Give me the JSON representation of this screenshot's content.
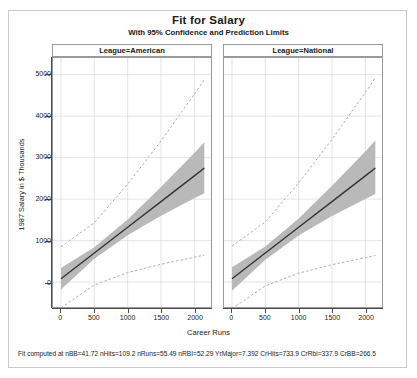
{
  "title": "Fit for Salary",
  "subtitle": "With 95% Confidence and Prediction Limits",
  "axes": {
    "ylabel": "1987 Salary in $ Thousands",
    "xlabel": "Career Runs",
    "yticks": [
      "0",
      "1000",
      "2000",
      "3000",
      "4000",
      "5000"
    ],
    "xticks": [
      "0",
      "500",
      "1000",
      "1500",
      "2000"
    ]
  },
  "panels": [
    {
      "header": "League=American"
    },
    {
      "header": "League=National"
    }
  ],
  "footnote": "Fit computed at nBB=41.72 nHits=109.2 nRuns=55.49 nRBI=52.29 YrMajor=7.392 CrHits=733.9 CrRbi=337.9 CrBB=266.5",
  "colors": {
    "fit_line": "#333333",
    "confidence_band": "#b9b9b9",
    "prediction_line": "#b0a8b8",
    "axis": "#4a4a4a",
    "grid": "#d8d8d8",
    "frame": "#9a9a9a"
  },
  "chart_data": {
    "type": "line",
    "title": "Fit for Salary",
    "subtitle": "With 95% Confidence and Prediction Limits",
    "xlabel": "Career Runs",
    "ylabel": "1987 Salary in $ Thousands",
    "xlim": [
      -120,
      2250
    ],
    "ylim": [
      -600,
      5400
    ],
    "grid": true,
    "legend": "none",
    "panel_variable": "League",
    "panels": [
      {
        "name": "League=American",
        "series": [
          {
            "name": "Fit",
            "style": "solid",
            "x": [
              0,
              500,
              1000,
              1500,
              2000,
              2150
            ],
            "values": [
              80,
              700,
              1320,
              1940,
              2560,
              2750
            ]
          },
          {
            "name": "95% Confidence Lower",
            "style": "band-lower",
            "x": [
              0,
              500,
              1000,
              1500,
              2000,
              2150
            ],
            "values": [
              -180,
              560,
              1130,
              1600,
              2020,
              2140
            ]
          },
          {
            "name": "95% Confidence Upper",
            "style": "band-upper",
            "x": [
              0,
              500,
              1000,
              1500,
              2000,
              2150
            ],
            "values": [
              340,
              840,
              1510,
              2290,
              3110,
              3370
            ]
          },
          {
            "name": "95% Prediction Lower",
            "style": "dashed",
            "x": [
              0,
              500,
              1000,
              1500,
              2000,
              2150
            ],
            "values": [
              -620,
              -70,
              230,
              430,
              600,
              650
            ]
          },
          {
            "name": "95% Prediction Upper",
            "style": "dashed",
            "x": [
              0,
              500,
              1000,
              1500,
              2000,
              2150
            ],
            "values": [
              850,
              1430,
              2360,
              3400,
              4530,
              4880
            ]
          }
        ]
      },
      {
        "name": "League=National",
        "series": [
          {
            "name": "Fit",
            "style": "solid",
            "x": [
              0,
              500,
              1000,
              1500,
              2000,
              2150
            ],
            "values": [
              80,
              700,
              1320,
              1940,
              2560,
              2750
            ]
          },
          {
            "name": "95% Confidence Lower",
            "style": "band-lower",
            "x": [
              0,
              500,
              1000,
              1500,
              2000,
              2150
            ],
            "values": [
              -210,
              540,
              1120,
              1590,
              2000,
              2120
            ]
          },
          {
            "name": "95% Confidence Upper",
            "style": "band-upper",
            "x": [
              0,
              500,
              1000,
              1500,
              2000,
              2150
            ],
            "values": [
              360,
              860,
              1530,
              2320,
              3150,
              3410
            ]
          },
          {
            "name": "95% Prediction Lower",
            "style": "dashed",
            "x": [
              0,
              500,
              1000,
              1500,
              2000,
              2150
            ],
            "values": [
              -640,
              -90,
              215,
              420,
              590,
              640
            ]
          },
          {
            "name": "95% Prediction Upper",
            "style": "dashed",
            "x": [
              0,
              500,
              1000,
              1500,
              2000,
              2150
            ],
            "values": [
              870,
              1450,
              2390,
              3440,
              4570,
              4920
            ]
          }
        ]
      }
    ]
  }
}
